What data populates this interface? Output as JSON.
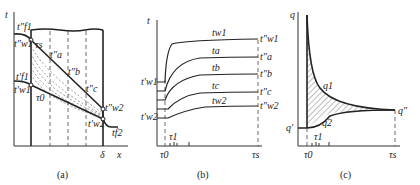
{
  "figure": {
    "panels": [
      {
        "id": "a",
        "caption": "(a)",
        "y_axis_label": "t",
        "x_axis_label": "x",
        "x_end_label": "δ",
        "labels": {
          "tf1_final": "t″f1",
          "tw1_final": "t″w1",
          "tau_s": "τs",
          "ta_final": "t″a",
          "tb_final": "t″b",
          "tc_final": "t″c",
          "tw2_final": "t″w2",
          "tf1_initial": "t′f1",
          "tw1_initial": "t′w1",
          "tau_0": "τ0",
          "tw2_initial": "t′w2",
          "tf2": "tf2"
        }
      },
      {
        "id": "b",
        "caption": "(b)",
        "y_axis_label": "t",
        "x_ticks": [
          "τ0",
          "τ1",
          "τs"
        ],
        "curves": [
          {
            "name": "tw1",
            "start": "t′w1",
            "end": "t″w1"
          },
          {
            "name": "ta",
            "start": "",
            "end": "t″a"
          },
          {
            "name": "tb",
            "start": "",
            "end": "t″b"
          },
          {
            "name": "tc",
            "start": "",
            "end": "t″c"
          },
          {
            "name": "tw2",
            "start": "t′w2",
            "end": "t″w2"
          }
        ]
      },
      {
        "id": "c",
        "caption": "(c)",
        "y_axis_label": "q",
        "x_ticks": [
          "τ0",
          "τ1",
          "τs"
        ],
        "labels": {
          "q_initial": "q′",
          "q_final": "q″",
          "q1": "q1",
          "q2": "q2"
        }
      }
    ]
  }
}
